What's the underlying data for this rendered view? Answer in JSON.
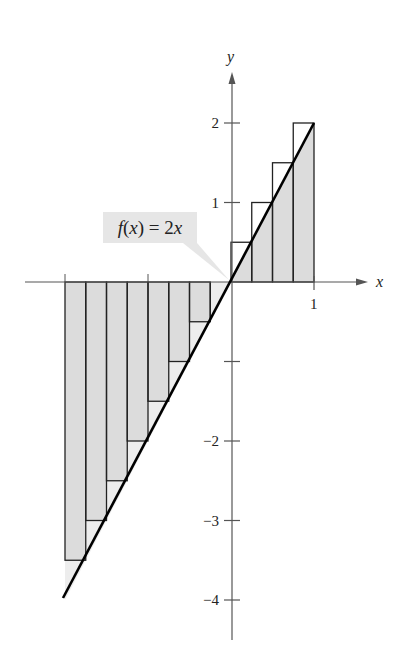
{
  "chart_data": {
    "type": "bar",
    "title": "",
    "function_label": "f(x) = 2x",
    "function": "2x",
    "xlabel": "x",
    "ylabel": "y",
    "xlim": [
      -2,
      1
    ],
    "ylim": [
      -4,
      2
    ],
    "x_ticks": [
      -2,
      -1,
      1
    ],
    "x_tick_labels": [
      "",
      "",
      "1"
    ],
    "y_ticks": [
      -4,
      -3,
      -2,
      -1,
      1,
      2
    ],
    "y_tick_labels": [
      "−4",
      "−3",
      "−2",
      "",
      "1",
      "2"
    ],
    "grid": false,
    "rectangle_method": "right endpoints",
    "delta_x": 0.25,
    "categories": [
      -2.0,
      -1.75,
      -1.5,
      -1.25,
      -1.0,
      -0.75,
      -0.5,
      -0.25,
      0.0,
      0.25,
      0.5,
      0.75
    ],
    "bar_right_edges": [
      -1.75,
      -1.5,
      -1.25,
      -1.0,
      -0.75,
      -0.5,
      -0.25,
      0.0,
      0.25,
      0.5,
      0.75,
      1.0
    ],
    "values": [
      -3.5,
      -3.0,
      -2.5,
      -2.0,
      -1.5,
      -1.0,
      -0.5,
      0.0,
      0.5,
      1.0,
      1.5,
      2.0
    ],
    "line": {
      "x": [
        -2,
        1
      ],
      "y": [
        -4,
        2
      ]
    }
  },
  "colors": {
    "bar_fill": "#dcdcdc",
    "gap_fill": "#ededed",
    "stroke": "#222222",
    "axis": "#555555",
    "label_bg": "#e6e6e6"
  },
  "label": {
    "f": "f",
    "x_open": "(",
    "x": "x",
    "x_close": ")",
    "eq": " = 2",
    "x2": "x"
  }
}
